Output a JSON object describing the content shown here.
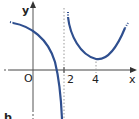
{
  "figure": {
    "label": "b",
    "axes": {
      "x_label": "x",
      "y_label": "y",
      "origin_label": "O",
      "x_ticks": [
        "2",
        "4"
      ]
    },
    "asymptote": {
      "x": 2,
      "style": "dotted"
    },
    "curve_color": "#2f4f8f"
  }
}
